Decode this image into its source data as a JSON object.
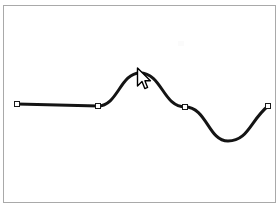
{
  "app": {
    "title": "Vector Path Editing Canvas",
    "canvas_background": "#ffffff",
    "frame_border_color": "#a9a9a9",
    "stroke_color": "#141414",
    "node_fill_color": "#ffffff",
    "node_border_color": "#1a1a1a"
  },
  "canvas": {
    "name": "drawing-canvas",
    "x": 3,
    "y": 5,
    "width": 273,
    "height": 198
  },
  "path": {
    "name": "bezier-sine-path",
    "stroke_width_straight": 3,
    "stroke_width_curve": 3,
    "segments": [
      {
        "type": "line",
        "from": [
          17,
          104
        ],
        "to": [
          98,
          106
        ]
      },
      {
        "type": "cubic",
        "from": [
          98,
          106
        ],
        "control1": [
          118,
          106
        ],
        "control2": [
          120,
          73
        ],
        "to": [
          140,
          73
        ]
      },
      {
        "type": "cubic",
        "from": [
          140,
          73
        ],
        "control1": [
          162,
          73
        ],
        "control2": [
          163,
          107
        ],
        "to": [
          185,
          107
        ]
      },
      {
        "type": "cubic",
        "from": [
          185,
          107
        ],
        "control1": [
          207,
          107
        ],
        "control2": [
          208,
          141
        ],
        "to": [
          228,
          141
        ]
      },
      {
        "type": "cubic",
        "from": [
          228,
          141
        ],
        "control1": [
          248,
          141
        ],
        "control2": [
          250,
          121
        ],
        "to": [
          268,
          106
        ]
      }
    ]
  },
  "nodes": [
    {
      "label": "anchor-point-1",
      "x": 17,
      "y": 104,
      "selected": false
    },
    {
      "label": "anchor-point-2",
      "x": 98,
      "y": 106,
      "selected": false
    },
    {
      "label": "anchor-point-3",
      "x": 185,
      "y": 107,
      "selected": false
    },
    {
      "label": "anchor-point-4",
      "x": 268,
      "y": 106,
      "selected": false
    }
  ],
  "cursor": {
    "name": "mouse-pointer",
    "type": "arrow",
    "tip_x": 138,
    "tip_y": 69,
    "fill": "#ffffff",
    "outline": "#000000"
  }
}
